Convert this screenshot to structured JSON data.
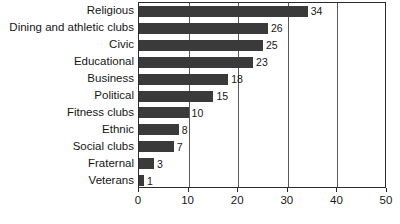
{
  "chart_data": {
    "type": "bar",
    "orientation": "horizontal",
    "title": "",
    "subtitle": "",
    "xlabel": "",
    "ylabel": "",
    "xlim": [
      0,
      50
    ],
    "xticks": [
      0,
      10,
      20,
      30,
      40,
      50
    ],
    "xtick_labels": [
      "0",
      "10",
      "20",
      "30",
      "40",
      "50"
    ],
    "grid": true,
    "grid_axis": "x",
    "legend": false,
    "legend_position": "none",
    "show_data_labels": true,
    "bar_color": "#3a3a3a",
    "frame_color": "#2b2b2b",
    "gridline_color": "#59595b",
    "background_color": "#ffffff",
    "categories": [
      "Religious",
      "Dining and athletic clubs",
      "Civic",
      "Educational",
      "Business",
      "Political",
      "Fitness clubs",
      "Ethnic",
      "Social clubs",
      "Fraternal",
      "Veterans"
    ],
    "values": [
      34,
      26,
      25,
      23,
      18,
      15,
      10,
      8,
      7,
      3,
      1
    ],
    "value_labels": [
      "34",
      "26",
      "25",
      "23",
      "18",
      "15",
      "10",
      "8",
      "7",
      "3",
      "1"
    ]
  }
}
